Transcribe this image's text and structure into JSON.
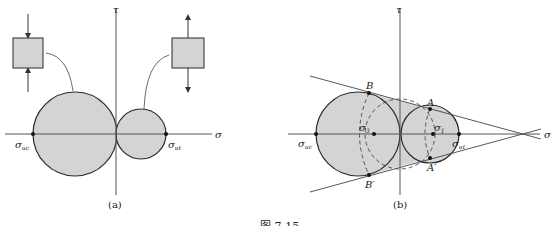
{
  "figure": {
    "caption_fragment": "图 7-15",
    "panels": [
      {
        "id": "a",
        "caption": "(a)",
        "axis_labels": {
          "vertical": "τ",
          "horizontal": "σ"
        },
        "point_labels": {
          "left": "σ",
          "left_sub": "uc",
          "right": "σ",
          "right_sub": "ut"
        },
        "insets": [
          "compression-element",
          "tension-element"
        ]
      },
      {
        "id": "b",
        "caption": "(b)",
        "axis_labels": {
          "vertical": "τ",
          "horizontal": "σ"
        },
        "point_labels": {
          "B": "B",
          "B_prime": "B′",
          "A": "A",
          "A_prime": "A′",
          "sigma3": "σ",
          "sigma3_sub": "3",
          "sigma1": "σ",
          "sigma1_sub": "1",
          "uc": "σ",
          "uc_sub": "uc",
          "ut": "σ",
          "ut_sub": "ut"
        }
      }
    ],
    "colors": {
      "fill": "#d4d4d4",
      "stroke": "#2a2a2a",
      "axis": "#555555",
      "leader": "#444444"
    }
  }
}
